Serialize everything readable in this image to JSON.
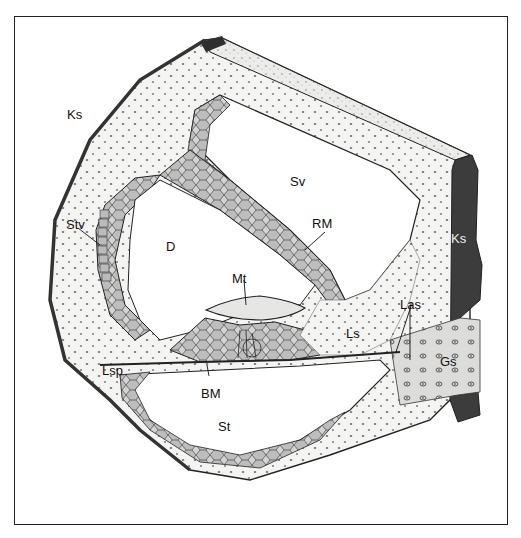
{
  "figure": {
    "type": "anatomical-illustration",
    "colors": {
      "ink": "#222222",
      "tissue": "#f2f2f0",
      "bone": "#3a3a3a",
      "cell_fill": "#c9c9c9",
      "background": "#ffffff"
    }
  },
  "labels": [
    {
      "id": "ks-left",
      "text": "Ks",
      "x": 67,
      "y": 108
    },
    {
      "id": "sv",
      "text": "Sv",
      "x": 290,
      "y": 175
    },
    {
      "id": "rm",
      "text": "RM",
      "x": 312,
      "y": 217
    },
    {
      "id": "stv",
      "text": "Stv",
      "x": 66,
      "y": 218
    },
    {
      "id": "d",
      "text": "D",
      "x": 166,
      "y": 240
    },
    {
      "id": "ks-right",
      "text": "Ks",
      "x": 451,
      "y": 232
    },
    {
      "id": "mt",
      "text": "Mt",
      "x": 232,
      "y": 272
    },
    {
      "id": "las",
      "text": "Las",
      "x": 400,
      "y": 298
    },
    {
      "id": "ls",
      "text": "Ls",
      "x": 346,
      "y": 327
    },
    {
      "id": "gs",
      "text": "Gs",
      "x": 440,
      "y": 355
    },
    {
      "id": "lsp",
      "text": "Lsp",
      "x": 102,
      "y": 364
    },
    {
      "id": "bm",
      "text": "BM",
      "x": 201,
      "y": 387
    },
    {
      "id": "st",
      "text": "St",
      "x": 218,
      "y": 420
    }
  ]
}
